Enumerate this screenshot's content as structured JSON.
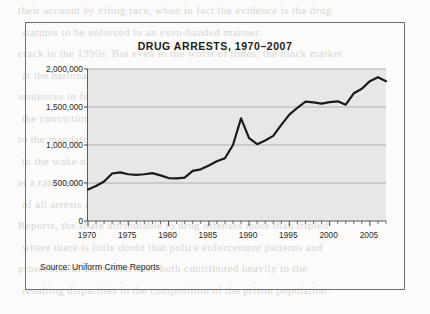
{
  "page": {
    "background_bleed_lines": [
      "their account by citing race, when in fact the evidence is the drug",
      "statutes to be enforced in an even-handed manner.",
      "crack in the 1990s. But even in the worst of times, the black market",
      "at the national profile, black people were only the second largest",
      "sentences in federal courts for crack cocaine, they would have",
      "the conviction rates for powder cocaine remained proportionate",
      "to the mandatory minimums imposed by the sentencing guidelines",
      "in the wake of the 1986 Anti-Drug Abuse Act and its successors,",
      "at a rate nearly three times that of the arrest rate for whites, and",
      "of all arrests made in the period covered by the Uniform Crime",
      "Reports, the share attributable to drug offenses more than tripled",
      "where there is little doubt that police enforcement patterns and",
      "prosecutorial discretion have both contributed heavily to the",
      "resulting disparities in the composition of the prison population."
    ]
  },
  "figure": {
    "source_note": "Source: Uniform Crime Reports",
    "border_color": "#6f6f6f"
  },
  "chart_data": {
    "type": "line",
    "title": "DRUG ARRESTS, 1970–2007",
    "xlabel": "",
    "ylabel": "",
    "xlim": [
      1970,
      2007
    ],
    "ylim": [
      0,
      2000000
    ],
    "grid": true,
    "grid_axis": "y",
    "legend": "none",
    "plot_background": "#e7e7e7",
    "line_color": "#1a1a1a",
    "line_width": 2.2,
    "y_ticks": [
      0,
      500000,
      1000000,
      1500000,
      2000000
    ],
    "y_tick_labels": [
      "0",
      "500,000",
      "1,000,000",
      "1,500,000",
      "2,000,000"
    ],
    "x_ticks": [
      1970,
      1975,
      1980,
      1985,
      1990,
      1995,
      2000,
      2005
    ],
    "x_tick_labels": [
      "1970",
      "1975",
      "1980",
      "1985",
      "1990",
      "1995",
      "2000",
      "2005"
    ],
    "x_minor_tick_interval": 1,
    "x": [
      1970,
      1971,
      1972,
      1973,
      1974,
      1975,
      1976,
      1977,
      1978,
      1979,
      1980,
      1981,
      1982,
      1983,
      1984,
      1985,
      1986,
      1987,
      1988,
      1989,
      1990,
      1991,
      1992,
      1993,
      1994,
      1995,
      1996,
      1997,
      1998,
      1999,
      2000,
      2001,
      2002,
      2003,
      2004,
      2005,
      2006,
      2007
    ],
    "series": [
      {
        "name": "Drug arrests",
        "values": [
          415000,
          460000,
          520000,
          625000,
          640000,
          615000,
          608000,
          615000,
          630000,
          600000,
          565000,
          560000,
          570000,
          660000,
          680000,
          730000,
          785000,
          825000,
          1000000,
          1350000,
          1090000,
          1010000,
          1060000,
          1120000,
          1265000,
          1400000,
          1490000,
          1570000,
          1560000,
          1545000,
          1565000,
          1575000,
          1530000,
          1680000,
          1740000,
          1840000,
          1890000,
          1840000
        ]
      }
    ],
    "annotations": []
  }
}
